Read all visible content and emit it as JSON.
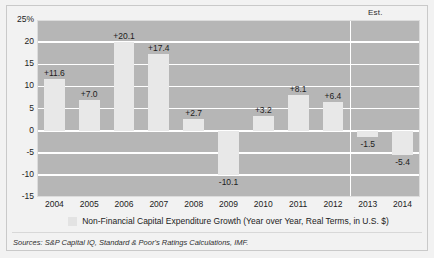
{
  "figure": {
    "est_label": "Est.",
    "source_note": "Sources: S&P Capital IQ, Standard & Poor's Ratings Calculations, IMF.",
    "legend_label": "Non-Financial Capital Expenditure Growth (Year over Year, Real Terms, in U.S. $)",
    "colors": {
      "plot_background": "#b6b6b6",
      "bar_fill": "#e8e8e8",
      "gridline": "#ffffff",
      "page_background": "#f2f2f2",
      "text": "#1c1c1c"
    }
  },
  "chart_data": {
    "type": "bar",
    "title": "",
    "subtitle": "",
    "xlabel": "",
    "ylabel": "",
    "categories": [
      "2004",
      "2005",
      "2006",
      "2007",
      "2008",
      "2009",
      "2010",
      "2011",
      "2012",
      "2013",
      "2014"
    ],
    "values": [
      11.6,
      7.0,
      20.1,
      17.4,
      2.7,
      -10.1,
      3.2,
      8.1,
      6.4,
      -1.5,
      -5.4
    ],
    "point_labels": [
      "+11.6",
      "+7.0",
      "+20.1",
      "+17.4",
      "+2.7",
      "-10.1",
      "+3.2",
      "+8.1",
      "+6.4",
      "-1.5",
      "-5.4"
    ],
    "series": [
      {
        "name": "Non-Financial Capital Expenditure Growth (Year over Year, Real Terms, in U.S. $)",
        "values": [
          11.6,
          7.0,
          20.1,
          17.4,
          2.7,
          -10.1,
          3.2,
          8.1,
          6.4,
          -1.5,
          -5.4
        ]
      }
    ],
    "ylim": [
      -15,
      25
    ],
    "yticks": [
      25,
      20,
      15,
      10,
      5,
      0,
      -5,
      -10,
      -15
    ],
    "ytick_labels": [
      "25%",
      "20",
      "15",
      "10",
      "5",
      "0",
      "-5",
      "-10",
      "-15"
    ],
    "grid": true,
    "legend_position": "bottom",
    "annotations": [
      {
        "text": "Est.",
        "applies_to": [
          "2013",
          "2014"
        ],
        "position": "top-right"
      }
    ],
    "estimated_categories": [
      "2013",
      "2014"
    ]
  }
}
